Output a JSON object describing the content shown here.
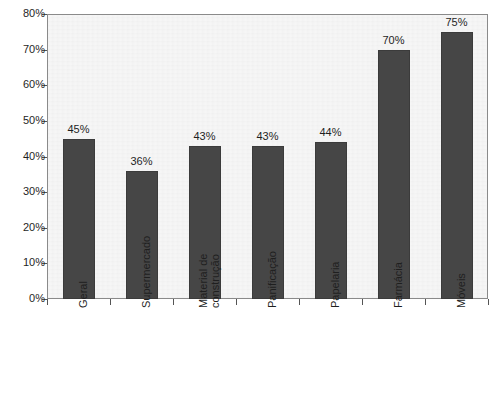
{
  "chart_data": {
    "type": "bar",
    "title": "",
    "subtitle": "",
    "xlabel": "",
    "ylabel": "",
    "categories": [
      "Geral",
      "Supermercado",
      "Material de construção",
      "Panificação",
      "Papelaria",
      "Farmácia",
      "Móveis"
    ],
    "category_lines": [
      [
        "Geral"
      ],
      [
        "Supermercado"
      ],
      [
        "Material de",
        "construção"
      ],
      [
        "Panificação"
      ],
      [
        "Papelaria"
      ],
      [
        "Farmácia"
      ],
      [
        "Móveis"
      ]
    ],
    "values": [
      45,
      36,
      43,
      43,
      44,
      70,
      75
    ],
    "value_labels": [
      "45%",
      "36%",
      "43%",
      "43%",
      "44%",
      "70%",
      "75%"
    ],
    "ylim": [
      0,
      80
    ],
    "ytick_values": [
      0,
      10,
      20,
      30,
      40,
      50,
      60,
      70,
      80
    ],
    "ytick_labels": [
      "0%",
      "10%",
      "20%",
      "30%",
      "40%",
      "50%",
      "60%",
      "70%",
      "80%"
    ],
    "grid": false,
    "legend": null,
    "legend_position": "none",
    "bar_color": "#464646",
    "plot_background": "#f7f7f7",
    "axis_color": "#8a8a8a",
    "text_color": "#1f1f1f",
    "label_rotation_degrees": 90
  }
}
